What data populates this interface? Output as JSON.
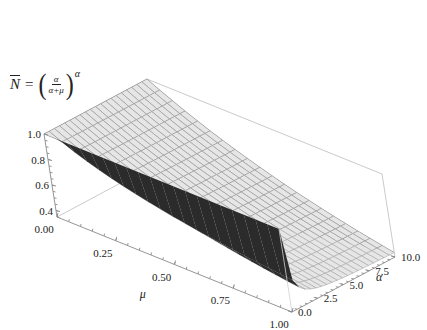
{
  "chart_data": {
    "type": "surface3d",
    "title_parts": {
      "lhs": "N",
      "eq": "=",
      "numerator": "α",
      "denominator": "α+μ",
      "exponent": "α",
      "open_paren": "(",
      "close_paren": ")"
    },
    "function": "N = (alpha/(alpha+mu))^alpha",
    "x_axis": {
      "name": "μ",
      "range": [
        0,
        1
      ],
      "ticks": [
        "0.00",
        "0.25",
        "0.50",
        "0.75",
        "1.00"
      ]
    },
    "y_axis": {
      "name": "α",
      "range": [
        0,
        10
      ],
      "ticks": [
        "0.0",
        "2.5",
        "5.0",
        "7.5",
        "10.0"
      ]
    },
    "z_axis": {
      "name": "",
      "range": [
        0.35,
        1.0
      ],
      "ticks": [
        "0.4",
        "0.6",
        "0.8",
        "1.0"
      ]
    },
    "surface": {
      "mu_samples": [
        0,
        0.05,
        0.1,
        0.15,
        0.2,
        0.25,
        0.3,
        0.35,
        0.4,
        0.45,
        0.5,
        0.55,
        0.6,
        0.65,
        0.7,
        0.75,
        0.8,
        0.85,
        0.9,
        0.95,
        1.0
      ],
      "alpha_samples": [
        0.0001,
        0.5,
        1,
        1.5,
        2,
        2.5,
        3,
        3.5,
        4,
        4.5,
        5,
        5.5,
        6,
        6.5,
        7,
        7.5,
        8,
        8.5,
        9,
        9.5,
        10
      ],
      "values_at_alpha_10": {
        "mu_0": 1.0,
        "mu_0.5": 0.614,
        "mu_1": 0.386
      },
      "values_at_alpha_1": {
        "mu_0": 1.0,
        "mu_0.5": 0.667,
        "mu_1": 0.5
      },
      "values_at_alpha_0": {
        "mu_0": 1.0,
        "mu_0.5": 1.0,
        "mu_1": 1.0
      }
    },
    "colors": {
      "surface_top": "#e6e6e6",
      "surface_under": "#2b2b2b",
      "mesh": "#9a9a9a",
      "box": "#bdbdbd",
      "axis": "#8a8a8a"
    },
    "grid": true,
    "legend": "none"
  }
}
